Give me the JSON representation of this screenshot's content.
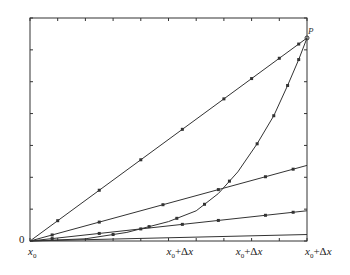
{
  "chart_data": {
    "type": "line",
    "title": "",
    "xlabel": "",
    "ylabel": "",
    "y_tick_label_origin": "0",
    "x_tick_labels": [
      {
        "base": "x",
        "sub": "0",
        "suffix": "",
        "pos": 0
      },
      {
        "base": "x",
        "sub": "0",
        "suffix": "+Δx",
        "pos": 0.5
      },
      {
        "base": "x",
        "sub": "0",
        "suffix": "+Δx",
        "pos": 0.75
      },
      {
        "base": "x",
        "sub": "0",
        "suffix": "+Δx",
        "pos": 1.0
      }
    ],
    "point_label": "P",
    "xlim": [
      0,
      1
    ],
    "ylim": [
      0,
      1
    ],
    "grid": false,
    "series": [
      {
        "name": "secant-steep",
        "kind": "line",
        "x": [
          0,
          1
        ],
        "y": [
          0,
          0.94
        ],
        "markers": [
          0.1,
          0.25,
          0.4,
          0.55,
          0.7,
          0.8,
          0.9,
          0.97
        ]
      },
      {
        "name": "secant-mid",
        "kind": "line",
        "x": [
          0,
          1
        ],
        "y": [
          0,
          0.35
        ],
        "markers": [
          0.08,
          0.25,
          0.48,
          0.68,
          0.85,
          0.95
        ]
      },
      {
        "name": "secant-low",
        "kind": "line",
        "x": [
          0,
          1
        ],
        "y": [
          0,
          0.14
        ],
        "markers": [
          0.08,
          0.25,
          0.4,
          0.55,
          0.68,
          0.85,
          0.95
        ]
      },
      {
        "name": "tangent",
        "kind": "line",
        "x": [
          0,
          1
        ],
        "y": [
          0,
          0.03
        ],
        "markers": []
      },
      {
        "name": "curve",
        "kind": "curve",
        "x": [
          0,
          0.2,
          0.35,
          0.5,
          0.6,
          0.68,
          0.75,
          0.82,
          0.88,
          0.93,
          0.97,
          1.0
        ],
        "y": [
          0,
          0.01,
          0.04,
          0.09,
          0.14,
          0.22,
          0.32,
          0.45,
          0.58,
          0.72,
          0.84,
          0.94
        ],
        "markers": [
          0.3,
          0.43,
          0.53,
          0.63,
          0.72,
          0.82,
          0.88,
          0.93,
          0.97
        ]
      }
    ]
  }
}
